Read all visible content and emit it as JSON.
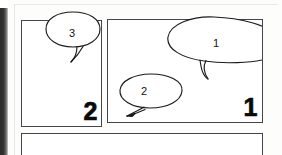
{
  "page": {
    "media_type": "comic-storyboard-page",
    "background_color": "#fdfdfc",
    "ink_color": "#1b1b1b",
    "panel_border_color": "#46464a",
    "gutter_shadow_color": "#2b2b2b"
  },
  "panels": [
    {
      "id": "panel-2",
      "number_label": "2",
      "position": "top-left",
      "number_corner": "bottom-right"
    },
    {
      "id": "panel-1",
      "number_label": "1",
      "position": "top-right",
      "number_corner": "bottom-right"
    },
    {
      "id": "panel-3",
      "number_label": "3",
      "position": "bottom-wide-cropped",
      "number_corner": "bottom-right"
    }
  ],
  "balloons": [
    {
      "id": "balloon-3",
      "label": "3",
      "shape": "ellipse",
      "tail_direction": "down-left",
      "in_panel": "panel-2"
    },
    {
      "id": "balloon-1",
      "label": "1",
      "shape": "wide-ellipse-clipped",
      "tail_direction": "down",
      "in_panel": "panel-1"
    },
    {
      "id": "balloon-2",
      "label": "2",
      "shape": "ellipse",
      "tail_direction": "down-left",
      "in_panel": "panel-1"
    }
  ]
}
